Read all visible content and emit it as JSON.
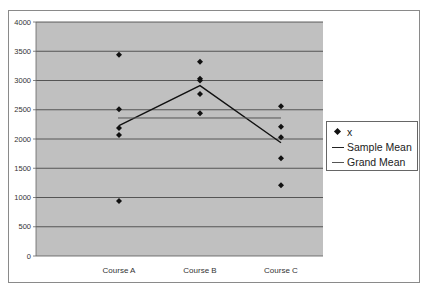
{
  "chart_data": {
    "type": "scatter",
    "title": "",
    "xlabel": "",
    "ylabel": "",
    "ylim": [
      0,
      4000
    ],
    "yticks": [
      0,
      500,
      1000,
      1500,
      2000,
      2500,
      3000,
      3500,
      4000
    ],
    "grid": true,
    "legend_position": "right",
    "categories": [
      "Course A",
      "Course B",
      "Course C"
    ],
    "series": [
      {
        "name": "x",
        "kind": "points",
        "marker": "diamond",
        "values": [
          [
            3440,
            2510,
            2190,
            2070,
            940
          ],
          [
            3320,
            3030,
            3000,
            2770,
            2440
          ],
          [
            2560,
            2210,
            2030,
            1670,
            1210
          ]
        ]
      },
      {
        "name": "Sample Mean",
        "kind": "line",
        "values": [
          2230,
          2912,
          1936
        ]
      },
      {
        "name": "Grand Mean",
        "kind": "line",
        "values": [
          2359,
          2359,
          2359
        ]
      }
    ]
  },
  "legend": {
    "items": [
      {
        "label": "x",
        "symbol": "diamond"
      },
      {
        "label": "Sample Mean",
        "symbol": "line"
      },
      {
        "label": "Grand Mean",
        "symbol": "line"
      }
    ]
  },
  "colors": {
    "plot_bg": "#c0c0c0",
    "gridline": "#3a3a3a",
    "marker": "#111111",
    "sample_mean": "#111111",
    "grand_mean": "#555555",
    "frame_border": "#8a8a8a"
  }
}
